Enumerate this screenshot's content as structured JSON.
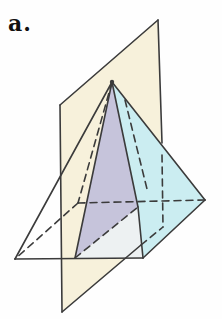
{
  "figure_label": "a.",
  "colors": {
    "background": "#fefefe",
    "line": "#3b3b3b",
    "plane_cream": "#f7f1db",
    "plane_cyan": "#cbedf1",
    "cross_section_purple": "#c6c4db",
    "base_white": "#edf1f2",
    "label_color": "#111111"
  },
  "diagram": {
    "width": 222,
    "height": 319,
    "line_width": 1.6,
    "dash_pattern": "7 5",
    "shapes": [
      {
        "name": "vertical-plane-face",
        "fill_key": "plane_cream",
        "points": [
          [
            60,
            105
          ],
          [
            158,
            20
          ],
          [
            163,
            227
          ],
          [
            62,
            312
          ]
        ]
      },
      {
        "name": "cyan-plane-face",
        "fill_key": "plane_cyan",
        "points": [
          [
            112,
            82
          ],
          [
            205,
            200
          ],
          [
            143,
            258
          ]
        ]
      },
      {
        "name": "base-visible-region",
        "fill_key": "base_white",
        "points": [
          [
            75,
            258
          ],
          [
            143,
            258
          ],
          [
            138,
            207
          ]
        ]
      },
      {
        "name": "cross-section-triangle",
        "fill_key": "cross_section_purple",
        "points": [
          [
            112,
            82
          ],
          [
            138,
            207
          ],
          [
            75,
            258
          ]
        ]
      }
    ],
    "solid_lines": [
      {
        "name": "plane-top-edge",
        "from": [
          60,
          105
        ],
        "to": [
          158,
          20
        ]
      },
      {
        "name": "plane-right-edge-upper",
        "from": [
          158,
          20
        ],
        "to": [
          162,
          143
        ]
      },
      {
        "name": "plane-left-edge",
        "from": [
          60,
          105
        ],
        "to": [
          62,
          312
        ]
      },
      {
        "name": "plane-bottom-edge-front",
        "from": [
          62,
          312
        ],
        "to": [
          141,
          245
        ]
      },
      {
        "name": "pyramid-left-slant-edge",
        "from": [
          112,
          82
        ],
        "to": [
          15,
          259
        ]
      },
      {
        "name": "base-front-edge",
        "from": [
          15,
          259
        ],
        "to": [
          143,
          258
        ]
      },
      {
        "name": "cross-section-left-edge",
        "from": [
          112,
          82
        ],
        "to": [
          75,
          258
        ]
      },
      {
        "name": "cross-section-right-edge",
        "from": [
          112,
          82
        ],
        "to": [
          138,
          207
        ]
      },
      {
        "name": "front-right-edge-lower",
        "from": [
          138,
          207
        ],
        "to": [
          143,
          258
        ]
      },
      {
        "name": "cyan-plane-top-edge",
        "from": [
          112,
          82
        ],
        "to": [
          205,
          200
        ]
      },
      {
        "name": "cyan-plane-bottom-edge",
        "from": [
          205,
          200
        ],
        "to": [
          143,
          258
        ]
      }
    ],
    "dashed_lines": [
      {
        "name": "hidden-back-left-slant-edge",
        "from": [
          112,
          82
        ],
        "to": [
          78,
          203
        ]
      },
      {
        "name": "hidden-back-base-edge",
        "from": [
          78,
          203
        ],
        "to": [
          205,
          200
        ]
      },
      {
        "name": "hidden-left-base-edge",
        "from": [
          78,
          203
        ],
        "to": [
          15,
          259
        ]
      },
      {
        "name": "hidden-base-chord",
        "from": [
          75,
          258
        ],
        "to": [
          138,
          207
        ]
      },
      {
        "name": "hidden-right-slant-edge",
        "from": [
          125,
          100
        ],
        "to": [
          148,
          193
        ]
      },
      {
        "name": "plane-right-edge-hidden",
        "from": [
          162,
          155
        ],
        "to": [
          163,
          227
        ]
      },
      {
        "name": "plane-bottom-edge-hidden",
        "from": [
          141,
          245
        ],
        "to": [
          163,
          227
        ]
      }
    ],
    "apex_dot": {
      "name": "apex-vertex-dot",
      "x": 112,
      "y": 82,
      "r": 2.2
    }
  }
}
